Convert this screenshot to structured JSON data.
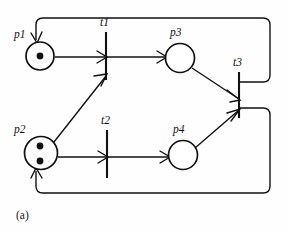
{
  "figure": {
    "caption": "(a)",
    "kind": "petri-net-diagram",
    "background_color": "#fefefe",
    "ink_color": "#111111"
  },
  "places": [
    {
      "id": "p1",
      "label": "p1",
      "cx": 40,
      "cy": 56,
      "r": 14,
      "tokens": 1,
      "label_x": 17,
      "label_y": 34
    },
    {
      "id": "p2",
      "label": "p2",
      "cx": 41,
      "cy": 153,
      "r": 16.5,
      "tokens": 2,
      "label_x": 17,
      "label_y": 130
    },
    {
      "id": "p3",
      "label": "p3",
      "cx": 180,
      "cy": 58,
      "r": 14.5,
      "tokens": 0,
      "label_x": 171,
      "label_y": 34
    },
    {
      "id": "p4",
      "label": "p4",
      "cx": 183,
      "cy": 155,
      "r": 14.5,
      "tokens": 0,
      "label_x": 174,
      "label_y": 131
    }
  ],
  "transitions": [
    {
      "id": "t1",
      "label": "t1",
      "x": 106,
      "y1": 32,
      "y2": 80,
      "label_x": 100,
      "label_y": 26
    },
    {
      "id": "t2",
      "label": "t2",
      "x": 107,
      "y1": 130,
      "y2": 178,
      "label_x": 101,
      "label_y": 124
    },
    {
      "id": "t3",
      "label": "t3",
      "x": 239,
      "y1": 72,
      "y2": 118,
      "label_x": 233,
      "label_y": 66
    }
  ],
  "arcs": [
    {
      "id": "arc-p1-t1",
      "from": "p1",
      "to": "t1",
      "type": "straight"
    },
    {
      "id": "arc-t1-p3",
      "from": "t1",
      "to": "p3",
      "type": "straight"
    },
    {
      "id": "arc-p2-t1",
      "from": "p2",
      "to": "t1",
      "type": "diagonal"
    },
    {
      "id": "arc-p2-t2",
      "from": "p2",
      "to": "t2",
      "type": "straight"
    },
    {
      "id": "arc-t2-p4",
      "from": "t2",
      "to": "p4",
      "type": "straight"
    },
    {
      "id": "arc-p3-t3",
      "from": "p3",
      "to": "t3",
      "type": "diagonal"
    },
    {
      "id": "arc-p4-t3",
      "from": "p4",
      "to": "t3",
      "type": "diagonal"
    },
    {
      "id": "arc-t3-p1",
      "from": "t3",
      "to": "p1",
      "type": "loop-top"
    },
    {
      "id": "arc-t3-p2",
      "from": "t3",
      "to": "p2",
      "type": "loop-bottom"
    }
  ],
  "marking": {
    "p1": 1,
    "p2": 2,
    "p3": 0,
    "p4": 0
  }
}
